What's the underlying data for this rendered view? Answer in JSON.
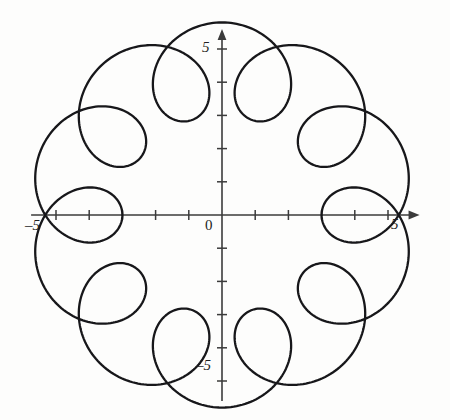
{
  "figure": {
    "name": "epitrochoid-plot",
    "background_color": "#fdfdfc",
    "curve_color": "#17171a",
    "axis_color": "#3b3b3b",
    "width": 450,
    "height": 420
  },
  "labels": {
    "x_positive": "5",
    "x_negative": "–5",
    "y_positive": "5",
    "y_negative": "–5",
    "origin": "0"
  },
  "chart_data": {
    "type": "line",
    "title": "",
    "subtitle": "",
    "xlabel": "",
    "ylabel": "",
    "grid": false,
    "legend": "none",
    "axes_style": "arrowed-cartesian-cross",
    "xlim": [
      -5.75,
      5.95
    ],
    "ylim": [
      -5.6,
      5.6
    ],
    "xticks": [
      -5,
      -4,
      -3,
      -2,
      -1,
      1,
      2,
      3,
      4,
      5
    ],
    "yticks": [
      -5,
      -4,
      -3,
      -2,
      -1,
      1,
      2,
      3,
      4,
      5
    ],
    "xtick_labels": [
      "–5",
      "",
      "",
      "",
      "",
      "",
      "",
      "",
      "",
      "5"
    ],
    "ytick_labels": [
      "–5",
      "",
      "",
      "",
      "",
      "",
      "",
      "",
      "",
      "5"
    ],
    "origin_label": "0",
    "curve": {
      "name": "epitrochoid",
      "family": "epitrochoid",
      "equations": {
        "x": "(R + r) * cos(t) - d * cos(((R + r) / r) * t)",
        "y": "(R + r) * sin(t) - d * sin(((R + r) / r) * t)"
      },
      "parameters": {
        "R": 4.0,
        "r": 0.4,
        "d": 1.4
      },
      "t_range": [
        0,
        6.283185307179586
      ],
      "n_lobes": 10,
      "n_inner_loops": 10,
      "outer_radius": 5.4,
      "inner_loop_tip_radius": 2.2,
      "samples": 1400,
      "closed": true
    }
  }
}
